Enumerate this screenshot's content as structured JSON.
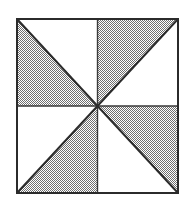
{
  "figure": {
    "canvas": {
      "width": 193,
      "height": 209,
      "background_color": "#ffffff"
    },
    "square": {
      "x": 17,
      "y": 19,
      "width": 161,
      "height": 174,
      "left": 17,
      "top": 19,
      "right": 178,
      "bottom": 193,
      "center_x": 97.5,
      "center_y": 106,
      "border_color": "#2b2b2b",
      "border_width": 2
    },
    "grid": {
      "vertical_midline_x": 97.5,
      "horizontal_midline_y": 106,
      "line_color": "#3a3a3a",
      "line_width": 1.4
    },
    "diagonals": {
      "line_color": "#2b2b2b",
      "line_width": 2,
      "main_diagonal": "top-left to bottom-right",
      "anti_diagonal": "bottom-left to top-right"
    },
    "fill": {
      "pattern": "checkerboard-stipple",
      "pattern_dark_color": "#6f6f6f",
      "pattern_light_color": "#ffffff",
      "pattern_cell_px": 1,
      "unshaded_color": "#ffffff",
      "approx_gray_level": "50%"
    },
    "quadrants": [
      {
        "name": "top-left",
        "diagonal": "main",
        "shaded_triangle": "lower-left",
        "shaded": true,
        "points": "17,19 17,106 97.5,106"
      },
      {
        "name": "top-left-unshaded",
        "diagonal": "main",
        "shaded_triangle": "upper-right",
        "shaded": false,
        "points": "17,19 97.5,19 97.5,106"
      },
      {
        "name": "top-right",
        "diagonal": "anti",
        "shaded_triangle": "upper-left",
        "shaded": true,
        "points": "97.5,19 178,19 97.5,106"
      },
      {
        "name": "top-right-unshaded",
        "diagonal": "anti",
        "shaded_triangle": "lower-right",
        "shaded": false,
        "points": "178,19 178,106 97.5,106"
      },
      {
        "name": "bottom-left",
        "diagonal": "anti",
        "shaded_triangle": "lower-right",
        "shaded": true,
        "points": "97.5,106 97.5,193 17,193"
      },
      {
        "name": "bottom-left-unshaded",
        "diagonal": "anti",
        "shaded_triangle": "upper-left",
        "shaded": false,
        "points": "17,106 97.5,106 17,193"
      },
      {
        "name": "bottom-right",
        "diagonal": "main",
        "shaded_triangle": "upper-right",
        "shaded": true,
        "points": "97.5,106 178,106 178,193"
      },
      {
        "name": "bottom-right-unshaded",
        "diagonal": "main",
        "shaded_triangle": "lower-left",
        "shaded": false,
        "points": "97.5,106 178,193 97.5,193"
      }
    ],
    "counts": {
      "total_triangles": 8,
      "shaded_triangles": 4,
      "unshaded_triangles": 4,
      "quadrants": 4
    }
  }
}
